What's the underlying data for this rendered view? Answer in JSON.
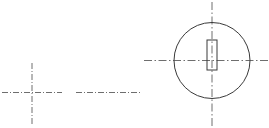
{
  "drawing": {
    "title": "",
    "width": 269,
    "height": 128,
    "background_color": "#ffffff",
    "line_color": "#3a3a3a",
    "centerline_color": "#6e6e6e",
    "units": "px",
    "elements": {
      "circle": {
        "label": "outer-circle",
        "cx": 212,
        "cy": 60.5,
        "r": 38,
        "stroke_width": 1.0,
        "style": "solid"
      },
      "rectangle": {
        "label": "inner-slot",
        "x": 207,
        "y": 40,
        "width": 10,
        "height": 30,
        "stroke_width": 1.0,
        "style": "solid"
      },
      "circle_horizontal_centerline": {
        "label": "horizontal-centerline",
        "x1": 144,
        "y1": 60.5,
        "x2": 269,
        "y2": 60.5,
        "style": "dash-dot"
      },
      "circle_vertical_centerline": {
        "label": "vertical-centerline",
        "x1": 212,
        "y1": 2,
        "x2": 212,
        "y2": 127,
        "style": "dash-dot"
      },
      "left_cross_horizontal": {
        "label": "left-cross-horizontal-centerline",
        "x1": 2,
        "y1": 92.5,
        "x2": 62,
        "y2": 92.5,
        "style": "dash-dot"
      },
      "left_cross_vertical": {
        "label": "left-cross-vertical-centerline",
        "x1": 32,
        "y1": 63,
        "x2": 32,
        "y2": 126,
        "style": "dash-dot"
      },
      "middle_centerline": {
        "label": "middle-horizontal-centerline",
        "x1": 76,
        "y1": 92.5,
        "x2": 140,
        "y2": 92.5,
        "style": "dash-dot"
      }
    }
  }
}
